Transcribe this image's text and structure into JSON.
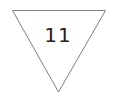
{
  "diagram": {
    "shape": "inverted-triangle",
    "label": "11",
    "stroke_color": "#808080",
    "fill_color": "#ffffff",
    "text_color": "#222222"
  }
}
